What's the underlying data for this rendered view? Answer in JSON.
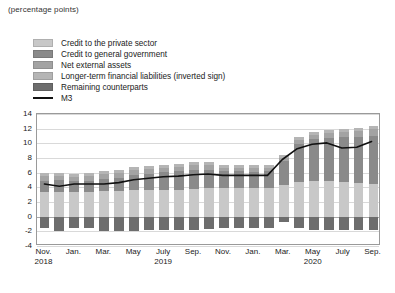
{
  "unit_label": "(percentage points)",
  "legend": {
    "items": [
      {
        "label": "Credit to the private sector",
        "color": "#c8c8c8",
        "type": "swatch",
        "name": "credit-private-sector"
      },
      {
        "label": "Credit to general government",
        "color": "#8a8a8a",
        "type": "swatch",
        "name": "credit-general-government"
      },
      {
        "label": "Net external assets",
        "color": "#a3a3a3",
        "type": "swatch",
        "name": "net-external-assets"
      },
      {
        "label": "Longer-term financial liabilities (inverted sign)",
        "color": "#b5b5b5",
        "type": "swatch",
        "name": "longer-term-financial-liabilities"
      },
      {
        "label": "Remaining counterparts",
        "color": "#6d6d6d",
        "type": "swatch",
        "name": "remaining-counterparts"
      },
      {
        "label": "M3",
        "color": "#111111",
        "type": "line",
        "name": "m3-line"
      }
    ]
  },
  "chart_data": {
    "type": "bar",
    "title": "",
    "subtitle": "",
    "xlabel": "",
    "ylabel": "",
    "unit": "percentage points",
    "ylim": [
      -4,
      14
    ],
    "yticks": [
      14,
      12,
      10,
      8,
      6,
      4,
      2,
      0,
      -2,
      -4
    ],
    "grid": true,
    "stacked": true,
    "legend_position": "top-left",
    "x": [
      "Nov. 2018",
      "Dec. 2018",
      "Jan. 2019",
      "Feb. 2019",
      "Mar. 2019",
      "Apr. 2019",
      "May 2019",
      "June 2019",
      "July 2019",
      "Aug. 2019",
      "Sep. 2019",
      "Oct. 2019",
      "Nov. 2019",
      "Dec. 2019",
      "Jan. 2020",
      "Feb. 2020",
      "Mar. 2020",
      "Apr. 2020",
      "May 2020",
      "June 2020",
      "July 2020",
      "Aug. 2020",
      "Sep. 2020"
    ],
    "xtick_labels": [
      {
        "index": 0,
        "month": "Nov.",
        "year": "2018"
      },
      {
        "index": 2,
        "month": "Jan.",
        "year": ""
      },
      {
        "index": 4,
        "month": "Mar.",
        "year": ""
      },
      {
        "index": 6,
        "month": "May",
        "year": ""
      },
      {
        "index": 8,
        "month": "July",
        "year": "2019"
      },
      {
        "index": 10,
        "month": "Sep.",
        "year": ""
      },
      {
        "index": 12,
        "month": "Nov.",
        "year": ""
      },
      {
        "index": 14,
        "month": "Jan.",
        "year": ""
      },
      {
        "index": 16,
        "month": "Mar.",
        "year": ""
      },
      {
        "index": 18,
        "month": "May",
        "year": "2020"
      },
      {
        "index": 20,
        "month": "July",
        "year": ""
      },
      {
        "index": 22,
        "month": "Sep.",
        "year": ""
      }
    ],
    "series": [
      {
        "name": "Credit to the private sector",
        "color": "#c8c8c8",
        "values": [
          3.4,
          3.4,
          3.4,
          3.4,
          3.5,
          3.5,
          3.6,
          3.6,
          3.7,
          3.7,
          3.8,
          3.9,
          3.9,
          3.9,
          3.9,
          3.9,
          4.3,
          4.7,
          4.8,
          4.8,
          4.7,
          4.6,
          4.5
        ]
      },
      {
        "name": "Credit to general government",
        "color": "#8a8a8a",
        "values": [
          1.5,
          1.6,
          1.4,
          1.5,
          1.7,
          1.8,
          2.1,
          2.2,
          2.4,
          2.5,
          2.6,
          2.5,
          2.3,
          2.3,
          2.2,
          2.3,
          3.3,
          5.2,
          5.8,
          5.9,
          6.1,
          6.2,
          6.5
        ]
      },
      {
        "name": "Net external assets",
        "color": "#a3a3a3",
        "values": [
          0.6,
          0.5,
          0.6,
          0.6,
          0.6,
          0.7,
          0.7,
          0.7,
          0.6,
          0.6,
          0.6,
          0.6,
          0.5,
          0.5,
          0.5,
          0.5,
          0.4,
          0.5,
          0.6,
          0.7,
          0.8,
          0.9,
          1.0
        ]
      },
      {
        "name": "Longer-term financial liabilities (inverted sign)",
        "color": "#b5b5b5",
        "values": [
          0.4,
          0.4,
          0.4,
          0.4,
          0.4,
          0.4,
          0.4,
          0.4,
          0.4,
          0.4,
          0.4,
          0.4,
          0.4,
          0.4,
          0.4,
          0.4,
          0.4,
          0.4,
          0.4,
          0.4,
          0.4,
          0.4,
          0.4
        ]
      },
      {
        "name": "Remaining counterparts",
        "color": "#6d6d6d",
        "values": [
          -1.6,
          -1.9,
          -1.5,
          -1.6,
          -1.9,
          -1.9,
          -1.9,
          -1.8,
          -1.8,
          -1.8,
          -1.8,
          -1.7,
          -1.6,
          -1.6,
          -1.5,
          -1.6,
          -0.7,
          -1.6,
          -1.8,
          -1.8,
          -1.8,
          -1.8,
          -1.8
        ]
      }
    ],
    "line_series": {
      "name": "M3",
      "color": "#111111",
      "values": [
        4.3,
        4.0,
        4.3,
        4.3,
        4.3,
        4.5,
        4.9,
        5.1,
        5.3,
        5.4,
        5.6,
        5.7,
        5.5,
        5.5,
        5.5,
        5.5,
        7.7,
        9.2,
        9.8,
        10.0,
        9.3,
        9.4,
        10.2
      ]
    }
  }
}
